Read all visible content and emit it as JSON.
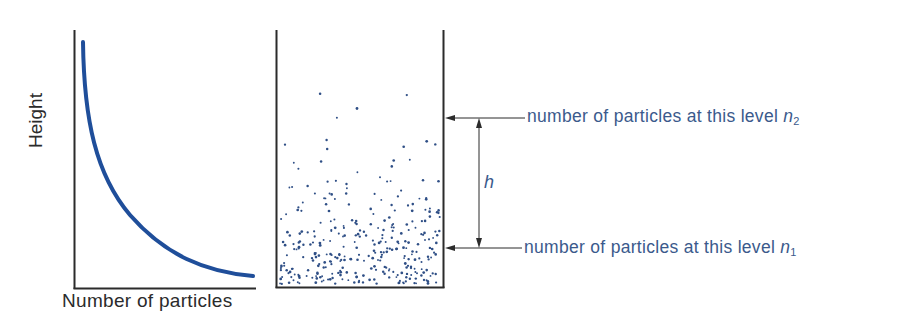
{
  "graph": {
    "xlabel": "Number of particles",
    "ylabel": "Height",
    "curve_color": "#1f4e9a",
    "axis_color": "#2b2b2b"
  },
  "container": {
    "dot_color": "#2f4f86",
    "dot_count": 330,
    "density": "exponential-decay-with-height"
  },
  "annotations": {
    "upper": {
      "text": "number of particles at this level ",
      "var": "n",
      "sub": "2"
    },
    "lower": {
      "text": "number of particles at this level ",
      "var": "n",
      "sub": "1"
    },
    "height_label": "h"
  },
  "colors": {
    "label_blue": "#3b5a8c",
    "text_dark": "#2b2b2b"
  },
  "chart_data": {
    "type": "line",
    "title": "",
    "xlabel": "Number of particles",
    "ylabel": "Height",
    "x": [
      0.05,
      0.1,
      0.2,
      0.3,
      0.4,
      0.5,
      0.6,
      0.7,
      0.8,
      0.9,
      1.0
    ],
    "y": [
      0.95,
      0.72,
      0.5,
      0.37,
      0.28,
      0.2,
      0.15,
      0.1,
      0.07,
      0.04,
      0.02
    ],
    "grid": false
  }
}
